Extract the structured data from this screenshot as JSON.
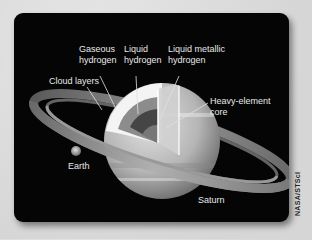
{
  "diagram": {
    "labels": {
      "gaseous_hydrogen": "Gaseous\nhydrogen",
      "liquid_hydrogen": "Liquid\nhydrogen",
      "liquid_metallic_hydrogen": "Liquid metallic\nhydrogen",
      "cloud_layers": "Cloud layers",
      "heavy_element_core": "Heavy-element\ncore",
      "earth": "Earth",
      "saturn": "Saturn"
    },
    "credit": "NASA/STScI",
    "colors": {
      "background": "#050505",
      "page": "#dcdcdc",
      "label_text": "#e8e8e8",
      "planet_light": "#d8d8d8",
      "planet_mid": "#a8a8a8",
      "cutaway_outer": "#f2f2f2",
      "cutaway_liquid": "#8a8a8a",
      "cutaway_metallic": "#444444",
      "core": "#7a7a7a"
    }
  }
}
